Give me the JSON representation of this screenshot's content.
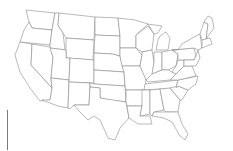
{
  "map": {
    "type": "us-states-outline",
    "fill_color": "#ffffff",
    "stroke_color": "#8a8a8a",
    "background": "#ffffff"
  },
  "states": [
    {
      "id": "WA",
      "d": "M26,10 L55,13 L52,30 L32,28 L29,22 Z"
    },
    {
      "id": "OR",
      "d": "M29,22 L32,28 L52,30 L50,45 L20,42 L24,30 Z"
    },
    {
      "id": "CA",
      "d": "M20,42 L32,44 L31,65 L52,88 L50,100 L40,101 L30,88 L20,72 L15,55 Z"
    },
    {
      "id": "ID",
      "d": "M55,13 L59,13 L58,25 L63,33 L65,50 L50,48 L50,45 L52,30 Z"
    },
    {
      "id": "NV",
      "d": "M32,44 L50,47 L53,57 L51,78 L52,88 L31,65 Z"
    },
    {
      "id": "MT",
      "d": "M59,13 L95,17 L94,40 L66,38 L63,33 L58,25 Z"
    },
    {
      "id": "WY",
      "d": "M66,38 L94,40 L93,60 L66,58 Z"
    },
    {
      "id": "UT",
      "d": "M50,48 L66,50 L66,58 L70,58 L69,80 L51,78 L53,57 Z"
    },
    {
      "id": "AZ",
      "d": "M51,78 L69,80 L68,108 L58,106 L42,100 L50,100 L52,88 Z"
    },
    {
      "id": "CO",
      "d": "M70,58 L94,60 L94,83 L69,82 Z"
    },
    {
      "id": "NM",
      "d": "M69,82 L90,83 L89,105 L74,105 L70,109 L68,108 Z"
    },
    {
      "id": "ND",
      "d": "M95,17 L118,18 L120,36 L95,35 Z"
    },
    {
      "id": "SD",
      "d": "M95,35 L120,36 L120,56 L112,54 L94,53 Z"
    },
    {
      "id": "NE",
      "d": "M94,53 L112,54 L120,56 L124,72 L94,70 L94,60 Z"
    },
    {
      "id": "KS",
      "d": "M94,70 L124,72 L125,86 L94,84 Z"
    },
    {
      "id": "OK",
      "d": "M90,83 L94,84 L125,86 L126,102 L110,100 L100,98 L100,88 L90,87 Z"
    },
    {
      "id": "TX",
      "d": "M90,87 L100,88 L100,98 L126,102 L129,118 L120,128 L115,140 L108,138 L100,120 L94,116 L88,120 L80,112 L74,105 L89,105 Z"
    },
    {
      "id": "MN",
      "d": "M118,18 L135,20 L148,24 L136,35 L136,48 L120,48 L120,36 Z"
    },
    {
      "id": "IA",
      "d": "M120,48 L136,48 L142,55 L140,66 L122,66 L120,56 Z"
    },
    {
      "id": "MO",
      "d": "M122,66 L140,66 L146,78 L145,90 L126,90 L125,86 L124,72 Z"
    },
    {
      "id": "AR",
      "d": "M126,90 L145,90 L142,106 L127,106 L126,102 Z"
    },
    {
      "id": "LA",
      "d": "M127,106 L142,106 L140,116 L150,116 L152,124 L138,124 L129,118 Z"
    },
    {
      "id": "WI",
      "d": "M136,35 L148,26 L154,34 L152,50 L142,52 L136,48 Z"
    },
    {
      "id": "IL",
      "d": "M142,52 L152,50 L154,62 L152,78 L146,80 L140,66 L142,55 Z"
    },
    {
      "id": "MI",
      "d": "M148,24 L162,26 L158,33 L154,34 Z M160,36 L166,32 L170,38 L168,50 L156,50 L158,40 Z"
    },
    {
      "id": "IN",
      "d": "M154,52 L162,52 L162,70 L152,74 L154,62 Z"
    },
    {
      "id": "OH",
      "d": "M162,52 L172,50 L178,54 L176,66 L168,70 L162,70 Z"
    },
    {
      "id": "KY",
      "d": "M146,80 L152,74 L162,70 L168,70 L176,74 L170,80 L148,82 Z"
    },
    {
      "id": "TN",
      "d": "M145,84 L178,80 L176,88 L144,90 Z"
    },
    {
      "id": "MS",
      "d": "M142,90 L150,90 L150,114 L140,116 L142,106 Z"
    },
    {
      "id": "AL",
      "d": "M150,90 L160,89 L164,110 L154,112 L152,116 L150,114 Z"
    },
    {
      "id": "GA",
      "d": "M160,89 L170,88 L180,100 L178,112 L166,112 L164,110 Z"
    },
    {
      "id": "FL",
      "d": "M152,116 L154,112 L166,112 L178,112 L182,124 L188,134 L185,140 L180,136 L172,122 L164,118 Z"
    },
    {
      "id": "SC",
      "d": "M170,88 L178,86 L188,90 L182,100 L180,100 Z"
    },
    {
      "id": "NC",
      "d": "M176,88 L178,80 L198,76 L196,84 L188,90 L178,86 Z"
    },
    {
      "id": "VA",
      "d": "M170,80 L176,74 L184,66 L192,66 L196,76 L178,80 Z"
    },
    {
      "id": "WV",
      "d": "M176,66 L178,60 L184,60 L184,66 L176,74 L172,72 Z"
    },
    {
      "id": "PA",
      "d": "M172,50 L194,48 L196,56 L194,60 L178,60 L178,54 Z"
    },
    {
      "id": "NY",
      "d": "M178,50 L182,44 L196,36 L200,34 L202,48 L198,50 L194,48 L172,50 Z"
    },
    {
      "id": "MD-DE-NJ",
      "d": "M184,60 L194,60 L196,56 L198,50 L200,58 L196,66 L192,66 L184,66 Z"
    },
    {
      "id": "VT-NH",
      "d": "M200,34 L204,22 L208,24 L206,40 L202,40 Z"
    },
    {
      "id": "ME",
      "d": "M204,22 L208,16 L212,18 L214,28 L208,36 L206,40 L208,24 Z"
    },
    {
      "id": "MA-CT-RI",
      "d": "M202,40 L210,38 L212,44 L202,48 Z"
    }
  ],
  "scale_marker": {
    "x": 7,
    "y1": 110,
    "y2": 150
  }
}
